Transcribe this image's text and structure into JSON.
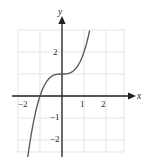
{
  "figure": {
    "background_color": "#ffffff",
    "grid_color": "#d8d8d8",
    "axis_color": "#231f20",
    "curve_color": "#58595b",
    "label_color": "#231f20"
  },
  "axes": {
    "x_axis_name": "x",
    "y_axis_name": "y",
    "x_ticks": [
      {
        "label": "−2",
        "value": -2
      },
      {
        "label": "1",
        "value": 1
      },
      {
        "label": "2",
        "value": 2
      }
    ],
    "y_ticks": [
      {
        "label": "2",
        "value": 2
      },
      {
        "label": "−1",
        "value": -1
      },
      {
        "label": "−2",
        "value": -2
      }
    ],
    "x_range": [
      -2.45,
      2.85
    ],
    "y_range": [
      -2.85,
      3.05
    ],
    "grid": true,
    "grid_step": 1
  },
  "chart_data": {
    "type": "line",
    "title": "",
    "xlabel": "x",
    "ylabel": "y",
    "xlim": [
      -2.45,
      2.85
    ],
    "ylim": [
      -2.85,
      3.05
    ],
    "grid": true,
    "legend": null,
    "series": [
      {
        "name": "y = x^3 + 1",
        "x": [
          -1.6,
          -1.5,
          -1.4,
          -1.3,
          -1.2,
          -1.1,
          -1.0,
          -0.9,
          -0.8,
          -0.7,
          -0.6,
          -0.5,
          -0.4,
          -0.3,
          -0.2,
          -0.1,
          0.0,
          0.1,
          0.2,
          0.3,
          0.4,
          0.5,
          0.6,
          0.7,
          0.8,
          0.9,
          1.0,
          1.1,
          1.2,
          1.25
        ],
        "y": [
          -3.096,
          -2.375,
          -1.744,
          -1.197,
          -0.728,
          -0.331,
          0.0,
          0.271,
          0.488,
          0.657,
          0.784,
          0.875,
          0.936,
          0.973,
          0.992,
          0.999,
          1.0,
          1.001,
          1.008,
          1.027,
          1.064,
          1.125,
          1.216,
          1.343,
          1.512,
          1.729,
          2.0,
          2.331,
          2.728,
          2.953
        ]
      }
    ]
  }
}
